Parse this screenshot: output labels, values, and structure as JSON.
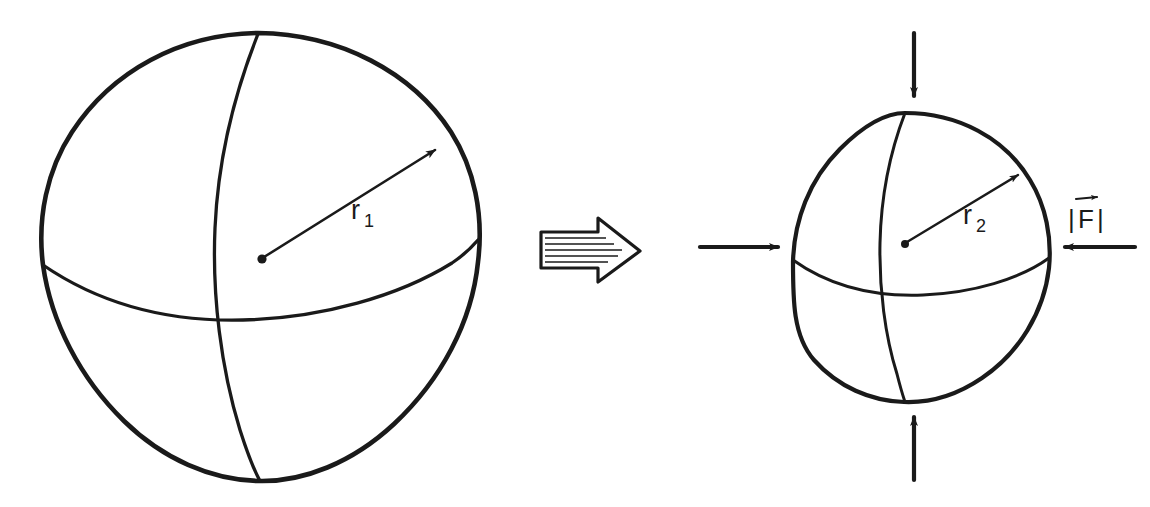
{
  "figure": {
    "background_color": "#ffffff",
    "ink_color": "#1a1a1a",
    "style": "hand-drawn line art"
  },
  "left_sphere": {
    "name": "uncompressed-sphere",
    "radius_label": "r",
    "radius_subscript": "1",
    "radius_label_full": "r1",
    "center_x": 262,
    "center_y": 257,
    "radius_px": 222,
    "has_meridian": true,
    "has_equator": true,
    "has_center_dot": true,
    "has_radius_arrow": true
  },
  "transition": {
    "name": "transition-arrow",
    "direction": "right",
    "style": "outlined block arrow with horizontal hatching",
    "hatch_line_count": 6,
    "x": 540,
    "y": 245
  },
  "right_sphere": {
    "name": "compressed-sphere",
    "radius_label": "r",
    "radius_subscript": "2",
    "radius_label_full": "r2",
    "center_x": 905,
    "center_y": 258,
    "radius_px": 145,
    "has_meridian": true,
    "has_equator": true,
    "has_center_dot": true,
    "has_radius_arrow": true
  },
  "force_label": {
    "name": "force-magnitude-label",
    "left_bar": "|",
    "symbol": "F",
    "right_bar": "|",
    "vector_arrow": true,
    "full_text": "|F|",
    "meaning": "magnitude of force vector"
  },
  "force_arrows": [
    {
      "name": "force-arrow-top",
      "direction": "down",
      "points_inward": true
    },
    {
      "name": "force-arrow-bottom",
      "direction": "up",
      "points_inward": true
    },
    {
      "name": "force-arrow-left",
      "direction": "right",
      "points_inward": true
    },
    {
      "name": "force-arrow-right",
      "direction": "left",
      "points_inward": true
    }
  ]
}
